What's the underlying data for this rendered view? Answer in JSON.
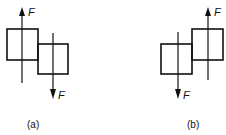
{
  "figures": [
    {
      "id": "a",
      "caption": "(a)",
      "up_force_label": "F",
      "down_force_label": "F",
      "description": "Two offset squares, left square higher; upward force F on left square, downward force F on right square"
    },
    {
      "id": "b",
      "caption": "(b)",
      "up_force_label": "F",
      "down_force_label": "F",
      "description": "Two offset squares, right square higher; downward force F on left square, upward force F on right square"
    }
  ],
  "colors": {
    "stroke": "#111111",
    "background": "#ffffff"
  }
}
